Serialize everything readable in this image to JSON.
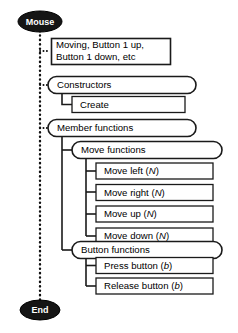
{
  "diagram": {
    "type": "hierarchy-tree",
    "colors": {
      "terminal_fill": "#151515",
      "terminal_text": "#ffffff",
      "box_fill": "#ffffff",
      "line": "#1a1a1a"
    },
    "start_node": {
      "label": "Mouse",
      "shape": "ellipse"
    },
    "end_node": {
      "label": "End",
      "shape": "ellipse"
    },
    "events_note": {
      "line1": "Moving, Button 1 up,",
      "line2": "Button 1 down, etc"
    },
    "branches": [
      {
        "label": "Constructors",
        "shape": "rounded",
        "children": [
          {
            "label": "Create",
            "shape": "rect"
          }
        ]
      },
      {
        "label": "Member functions",
        "shape": "rounded",
        "groups": [
          {
            "label": "Move functions",
            "shape": "rounded",
            "children": [
              {
                "label": "Move left",
                "param": "N",
                "shape": "rect"
              },
              {
                "label": "Move right",
                "param": "N",
                "shape": "rect"
              },
              {
                "label": "Move up",
                "param": "N",
                "shape": "rect"
              },
              {
                "label": "Move down",
                "param": "N",
                "shape": "rect"
              }
            ]
          },
          {
            "label": "Button functions",
            "shape": "rounded",
            "children": [
              {
                "label": "Press button",
                "param": "b",
                "shape": "rect"
              },
              {
                "label": "Release button",
                "param": "b",
                "shape": "rect"
              }
            ]
          }
        ]
      }
    ]
  }
}
